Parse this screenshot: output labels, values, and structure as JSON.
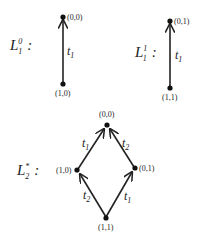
{
  "diagrams": [
    {
      "name": "L1^0",
      "label": {
        "base": "L",
        "sub": "1",
        "sup": "0",
        "suffix": ":"
      },
      "nodes": [
        {
          "id": "bottom",
          "label": "(1,0)"
        },
        {
          "id": "top",
          "label": "(0,0)"
        }
      ],
      "edges": [
        {
          "from": "(1,0)",
          "to": "(0,0)",
          "label": "t",
          "label_sub": "1"
        }
      ]
    },
    {
      "name": "L1^1",
      "label": {
        "base": "L",
        "sub": "1",
        "sup": "1",
        "suffix": ":"
      },
      "nodes": [
        {
          "id": "bottom",
          "label": "(1,1)"
        },
        {
          "id": "top",
          "label": "(0,1)"
        }
      ],
      "edges": [
        {
          "from": "(1,1)",
          "to": "(0,1)",
          "label": "t",
          "label_sub": "1"
        }
      ]
    },
    {
      "name": "L*2",
      "label": {
        "base": "L",
        "sub": "2",
        "sup": "*",
        "suffix": ":"
      },
      "nodes": [
        {
          "id": "top",
          "label": "(0,0)"
        },
        {
          "id": "left",
          "label": "(1,0)"
        },
        {
          "id": "right",
          "label": "(0,1)"
        },
        {
          "id": "bottom",
          "label": "(1,1)"
        }
      ],
      "edges": [
        {
          "from": "(1,0)",
          "to": "(0,0)",
          "label": "t",
          "label_sub": "1"
        },
        {
          "from": "(0,1)",
          "to": "(0,0)",
          "label": "t",
          "label_sub": "2"
        },
        {
          "from": "(1,1)",
          "to": "(1,0)",
          "label": "t",
          "label_sub": "2"
        },
        {
          "from": "(1,1)",
          "to": "(0,1)",
          "label": "t",
          "label_sub": "1"
        }
      ]
    }
  ],
  "colors": {
    "line": "#222222",
    "background": "#ffffff"
  }
}
